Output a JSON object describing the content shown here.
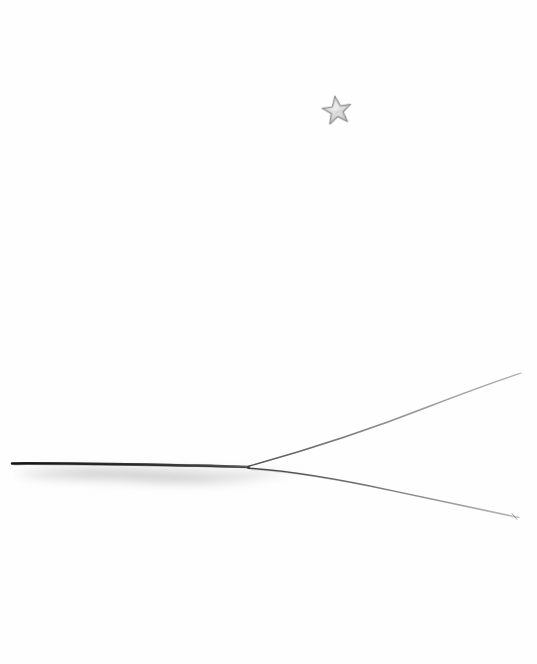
{
  "artwork": {
    "title": "Minimal pencil landscape sketch",
    "medium": "graphite pencil on white paper",
    "background_color": "#fefefe",
    "canvas": {
      "width": 537,
      "height": 664
    }
  },
  "elements": {
    "star": {
      "name": "five-pointed star",
      "center_x": 337,
      "center_y": 111,
      "outer_radius": 15,
      "inner_radius": 6.2,
      "rotation_deg": -8,
      "stroke_color": "#8d8d8d",
      "fill_color": "#e2e2e2",
      "stroke_width": 1.1
    },
    "horizon_line": {
      "name": "main horizon line",
      "start_x": 12,
      "start_y": 463,
      "end_x": 248,
      "end_y": 467,
      "stroke_color": "#1d1d1d",
      "stroke_width": 2.4
    },
    "ground_smudge": {
      "name": "soft graphite shading below horizon",
      "fill_color": "#c9c9c9",
      "opacity": 0.55,
      "left_x": 20,
      "right_x": 300,
      "top_y": 465,
      "bottom_y": 488
    },
    "upper_branch": {
      "name": "upper diverging line",
      "start_x": 248,
      "start_y": 466,
      "end_x": 521,
      "end_y": 373,
      "control_x": 390,
      "control_y": 432,
      "stroke_color": "#6d6d6d",
      "stroke_width": 1.2
    },
    "lower_branch": {
      "name": "lower diverging line",
      "start_x": 248,
      "start_y": 469,
      "end_x": 519,
      "end_y": 518,
      "control_x": 385,
      "control_y": 487,
      "stroke_color": "#5a5a5a",
      "stroke_width": 1.3
    },
    "end_tick": {
      "name": "small terminal tick mark",
      "x": 515,
      "y": 517,
      "stroke_color": "#7a7a7a"
    }
  },
  "labels": {
    "page_title": "Pencil Sketch",
    "alt_text": "A hand drawn pencil sketch showing a star above a horizon line that splits into two thin lines toward the right."
  }
}
